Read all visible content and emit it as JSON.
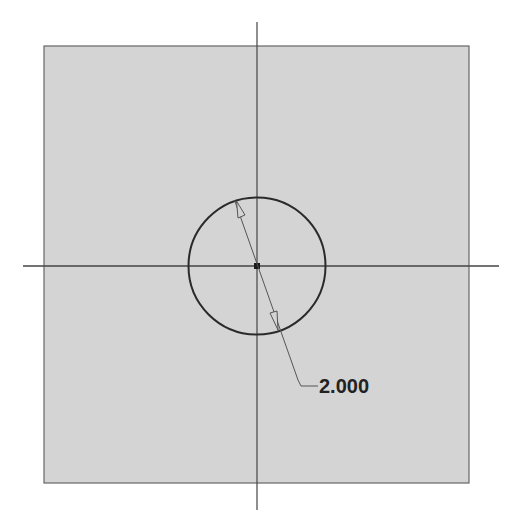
{
  "sketch": {
    "background_color": "#d4d4d4",
    "frame_color": "#555555",
    "axis_color": "#444444",
    "geometry_color": "#2a2a2a",
    "circle": {
      "center": [
        257,
        266
      ],
      "radius": 68
    },
    "dimension": {
      "type": "diameter",
      "value": "2.000"
    }
  }
}
